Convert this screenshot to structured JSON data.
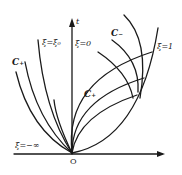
{
  "diagram": {
    "type": "phase-plane curves",
    "stroke_color": "#1a1a1a",
    "background": "#ffffff",
    "axes": {
      "vertical_label": "t",
      "origin_label": "O"
    },
    "labels": {
      "xi_eq_xi0": "ξ=ξ₀",
      "xi_eq_0": "ξ=0",
      "xi_eq_1": "ξ=1",
      "xi_eq_neg_inf": "ξ=−∞",
      "c_plus_left": "C₊",
      "c_plus_inner": "C₊",
      "c_minus": "C₋"
    }
  }
}
